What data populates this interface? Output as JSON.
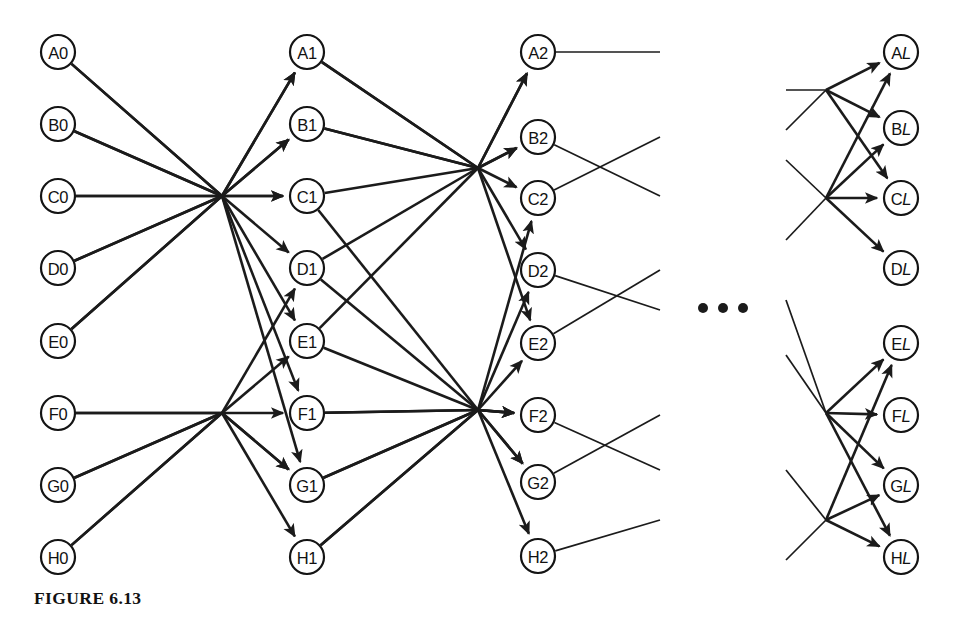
{
  "figure": {
    "caption": "FIGURE 6.13",
    "width": 959,
    "height": 625,
    "background_color": "#ffffff",
    "ink_color": "#1b1b1b"
  },
  "ellipsis": {
    "name": "stage-continuation-ellipsis",
    "glyph": "•••",
    "dots": 3,
    "x": [
      703,
      723,
      743
    ],
    "y": 308,
    "radius": 5
  },
  "geometry": {
    "node_radius": 17,
    "column_x": [
      58,
      307,
      538,
      901
    ],
    "hub_x": [
      222,
      478,
      826
    ],
    "row_y_even": [
      52,
      124,
      196,
      268,
      341,
      413,
      485,
      557
    ],
    "row_y_stage2": [
      52,
      137,
      198,
      270,
      343,
      415,
      482,
      556
    ],
    "stage_count": 4
  },
  "columns": [
    {
      "name": "stage-0",
      "index": 0,
      "x": 58,
      "nodes": [
        {
          "label": "A0",
          "letter": "A",
          "suffix": "0",
          "italic_suffix": false,
          "x": 58,
          "y": 52
        },
        {
          "label": "B0",
          "letter": "B",
          "suffix": "0",
          "italic_suffix": false,
          "x": 58,
          "y": 124
        },
        {
          "label": "C0",
          "letter": "C",
          "suffix": "0",
          "italic_suffix": false,
          "x": 58,
          "y": 196
        },
        {
          "label": "D0",
          "letter": "D",
          "suffix": "0",
          "italic_suffix": false,
          "x": 58,
          "y": 268
        },
        {
          "label": "E0",
          "letter": "E",
          "suffix": "0",
          "italic_suffix": false,
          "x": 58,
          "y": 341
        },
        {
          "label": "F0",
          "letter": "F",
          "suffix": "0",
          "italic_suffix": false,
          "x": 58,
          "y": 413
        },
        {
          "label": "G0",
          "letter": "G",
          "suffix": "0",
          "italic_suffix": false,
          "x": 58,
          "y": 485
        },
        {
          "label": "H0",
          "letter": "H",
          "suffix": "0",
          "italic_suffix": false,
          "x": 58,
          "y": 557
        }
      ]
    },
    {
      "name": "stage-1",
      "index": 1,
      "x": 307,
      "nodes": [
        {
          "label": "A1",
          "letter": "A",
          "suffix": "1",
          "italic_suffix": false,
          "x": 307,
          "y": 52
        },
        {
          "label": "B1",
          "letter": "B",
          "suffix": "1",
          "italic_suffix": false,
          "x": 307,
          "y": 124
        },
        {
          "label": "C1",
          "letter": "C",
          "suffix": "1",
          "italic_suffix": false,
          "x": 307,
          "y": 196
        },
        {
          "label": "D1",
          "letter": "D",
          "suffix": "1",
          "italic_suffix": false,
          "x": 307,
          "y": 268
        },
        {
          "label": "E1",
          "letter": "E",
          "suffix": "1",
          "italic_suffix": false,
          "x": 307,
          "y": 341
        },
        {
          "label": "F1",
          "letter": "F",
          "suffix": "1",
          "italic_suffix": false,
          "x": 307,
          "y": 413
        },
        {
          "label": "G1",
          "letter": "G",
          "suffix": "1",
          "italic_suffix": false,
          "x": 307,
          "y": 485
        },
        {
          "label": "H1",
          "letter": "H",
          "suffix": "1",
          "italic_suffix": false,
          "x": 307,
          "y": 557
        }
      ]
    },
    {
      "name": "stage-2",
      "index": 2,
      "x": 538,
      "nodes": [
        {
          "label": "A2",
          "letter": "A",
          "suffix": "2",
          "italic_suffix": false,
          "x": 538,
          "y": 52
        },
        {
          "label": "B2",
          "letter": "B",
          "suffix": "2",
          "italic_suffix": false,
          "x": 538,
          "y": 137
        },
        {
          "label": "C2",
          "letter": "C",
          "suffix": "2",
          "italic_suffix": false,
          "x": 538,
          "y": 198
        },
        {
          "label": "D2",
          "letter": "D",
          "suffix": "2",
          "italic_suffix": false,
          "x": 538,
          "y": 270
        },
        {
          "label": "E2",
          "letter": "E",
          "suffix": "2",
          "italic_suffix": false,
          "x": 538,
          "y": 343
        },
        {
          "label": "F2",
          "letter": "F",
          "suffix": "2",
          "italic_suffix": false,
          "x": 538,
          "y": 415
        },
        {
          "label": "G2",
          "letter": "G",
          "suffix": "2",
          "italic_suffix": false,
          "x": 538,
          "y": 482
        },
        {
          "label": "H2",
          "letter": "H",
          "suffix": "2",
          "italic_suffix": false,
          "x": 538,
          "y": 556
        }
      ]
    },
    {
      "name": "stage-L",
      "index": 3,
      "x": 901,
      "nodes": [
        {
          "label": "AL",
          "letter": "A",
          "suffix": "L",
          "italic_suffix": true,
          "x": 901,
          "y": 52
        },
        {
          "label": "BL",
          "letter": "B",
          "suffix": "L",
          "italic_suffix": true,
          "x": 901,
          "y": 128
        },
        {
          "label": "CL",
          "letter": "C",
          "suffix": "L",
          "italic_suffix": true,
          "x": 901,
          "y": 198
        },
        {
          "label": "DL",
          "letter": "D",
          "suffix": "L",
          "italic_suffix": true,
          "x": 901,
          "y": 268
        },
        {
          "label": "EL",
          "letter": "E",
          "suffix": "L",
          "italic_suffix": true,
          "x": 901,
          "y": 343
        },
        {
          "label": "FL",
          "letter": "F",
          "suffix": "L",
          "italic_suffix": true,
          "x": 901,
          "y": 415
        },
        {
          "label": "GL",
          "letter": "G",
          "suffix": "L",
          "italic_suffix": true,
          "x": 901,
          "y": 485
        },
        {
          "label": "HL",
          "letter": "H",
          "suffix": "L",
          "italic_suffix": true,
          "x": 901,
          "y": 557
        }
      ]
    }
  ],
  "edges": {
    "stage_0_to_1": [
      {
        "from": "A0",
        "to": "B1",
        "arrow": true
      },
      {
        "from": "A0",
        "to": "F1",
        "arrow": true
      },
      {
        "from": "B0",
        "to": "C1",
        "arrow": true
      },
      {
        "from": "B0",
        "to": "G1",
        "arrow": true
      },
      {
        "from": "C0",
        "to": "C1",
        "arrow": true
      },
      {
        "from": "C0",
        "to": "A1",
        "arrow": true
      },
      {
        "from": "D0",
        "to": "E1",
        "arrow": true
      },
      {
        "from": "D0",
        "to": "B1",
        "arrow": true
      },
      {
        "from": "E0",
        "to": "D1",
        "arrow": true
      },
      {
        "from": "E0",
        "to": "A1",
        "arrow": true
      },
      {
        "from": "F0",
        "to": "F1",
        "arrow": true
      },
      {
        "from": "F0",
        "to": "G1",
        "arrow": true
      },
      {
        "from": "G0",
        "to": "D1",
        "arrow": true
      },
      {
        "from": "G0",
        "to": "E1",
        "arrow": true
      },
      {
        "from": "H0",
        "to": "H1",
        "arrow": true
      },
      {
        "from": "H0",
        "to": "G1",
        "arrow": true
      }
    ],
    "stage_1_to_2": [
      {
        "from": "A1",
        "to": "A2",
        "arrow": true
      },
      {
        "from": "A1",
        "to": "C2",
        "arrow": true
      },
      {
        "from": "B1",
        "to": "B2",
        "arrow": true
      },
      {
        "from": "B1",
        "to": "E2",
        "arrow": true
      },
      {
        "from": "C1",
        "to": "A2",
        "arrow": true
      },
      {
        "from": "C1",
        "to": "G2",
        "arrow": true
      },
      {
        "from": "D1",
        "to": "D2",
        "arrow": true
      },
      {
        "from": "D1",
        "to": "F2",
        "arrow": true
      },
      {
        "from": "E1",
        "to": "B2",
        "arrow": true
      },
      {
        "from": "E1",
        "to": "D2",
        "arrow": true
      },
      {
        "from": "F1",
        "to": "C2",
        "arrow": true
      },
      {
        "from": "F1",
        "to": "F2",
        "arrow": true
      },
      {
        "from": "G1",
        "to": "E2",
        "arrow": true
      },
      {
        "from": "G1",
        "to": "G2",
        "arrow": true
      },
      {
        "from": "H1",
        "to": "H2",
        "arrow": true
      },
      {
        "from": "H1",
        "to": "F2",
        "arrow": true
      }
    ],
    "stage_L_incoming": [
      {
        "to": "AL",
        "arrow": true
      },
      {
        "to": "AL",
        "arrow": true
      },
      {
        "to": "BL",
        "arrow": true
      },
      {
        "to": "BL",
        "arrow": true
      },
      {
        "to": "CL",
        "arrow": true
      },
      {
        "to": "CL",
        "arrow": true
      },
      {
        "to": "DL",
        "arrow": true
      },
      {
        "to": "DL",
        "arrow": true
      },
      {
        "to": "EL",
        "arrow": true
      },
      {
        "to": "EL",
        "arrow": true
      },
      {
        "to": "FL",
        "arrow": true
      },
      {
        "to": "FL",
        "arrow": true
      },
      {
        "to": "GL",
        "arrow": true
      },
      {
        "to": "GL",
        "arrow": true
      },
      {
        "to": "HL",
        "arrow": true
      },
      {
        "to": "HL",
        "arrow": true
      }
    ]
  }
}
